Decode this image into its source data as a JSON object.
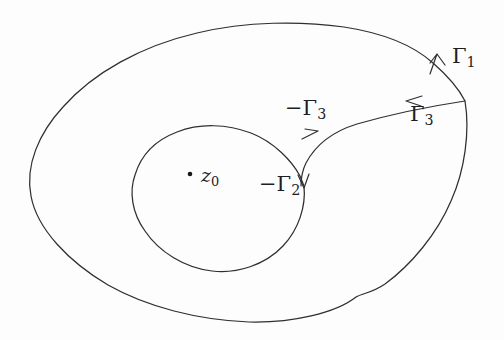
{
  "figure": {
    "background_color": "#fdfdfd",
    "ink_color": "#2e2e33",
    "width": 504,
    "height": 340
  },
  "labels": {
    "gamma1": {
      "text": "Γ",
      "subscript": "1",
      "full": "Γ1"
    },
    "gamma3": {
      "text": "Γ",
      "subscript": "3",
      "full": "Γ3"
    },
    "neg_gamma3": {
      "prefix": "−",
      "text": "Γ",
      "subscript": "3",
      "full": "−Γ3"
    },
    "neg_gamma2": {
      "prefix": "−",
      "text": "Γ",
      "subscript": "2",
      "full": "−Γ2"
    },
    "z0": {
      "text": "z",
      "subscript": "0",
      "full": "z0"
    }
  },
  "elements": {
    "outer_contour_name": "outer-contour-gamma1",
    "inner_contour_name": "inner-contour-gamma2",
    "cross_cut_name": "cross-cut-gamma3",
    "point_name": "point-z0"
  },
  "geometry": {
    "outer_contour_path": "M 465 101 C 470 130 466 168 452 200 C 438 233 412 264 386 283 C 366 298 360 294 352 300 C 330 315 290 323 250 322 C 200 320 150 308 110 286 C 70 263 38 230 31 196 C 25 166 38 134 62 107 C 92 73 140 46 196 33 C 246 21 300 21 343 27 C 382 33 412 44 432 62 C 448 76 459 88 465 101 Z",
    "inner_contour_path": "M 305 185 C 307 205 300 228 284 245 C 266 264 238 273 213 270 C 186 267 160 252 145 231 C 132 213 129 192 134 175 C 140 155 155 140 176 132 C 199 123 226 124 250 133 C 273 142 292 160 301 175 Z",
    "cut_line_path": "M 465 101 C 430 106 390 114 356 124 C 330 132 314 146 305 163 C 301 171 300 179 300 185",
    "gamma1_arrow_tip": [
      437,
      54
    ],
    "gamma3_arrow_tip": [
      406,
      101
    ],
    "neg_gamma3_arrow_tip": [
      318,
      131
    ],
    "neg_gamma2_arrow_tip": [
      304,
      187
    ],
    "z0_dot": [
      190,
      174
    ]
  }
}
